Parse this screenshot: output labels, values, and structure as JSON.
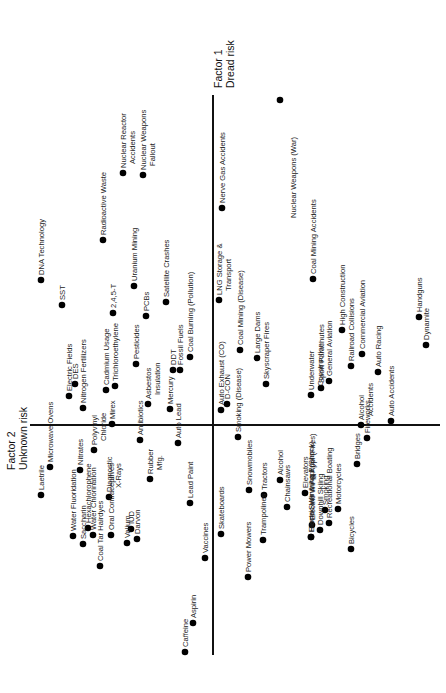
{
  "chart_data": {
    "type": "scatter",
    "title": "",
    "orientation": "rotated-90-ccw",
    "axes": {
      "factor1": {
        "label_line1": "Factor 1",
        "label_line2": "Dread risk",
        "pixel_position": {
          "x": 213,
          "y_top": 95,
          "y_bottom": 655
        }
      },
      "factor2": {
        "label_line1": "Factor 2",
        "label_line2": "Unknown risk",
        "pixel_position": {
          "y": 425,
          "x_left": 30,
          "x_right": 440
        }
      }
    },
    "xlabel": "Factor 1 Dread risk",
    "ylabel": "Factor 2 Unknown risk",
    "grid": false,
    "legend": null,
    "points": [
      {
        "label": "Nuclear Weapons (War)",
        "px": 280,
        "py": 100,
        "lines": [
          "Nuclear Weapons (War)"
        ],
        "lx": 296,
        "ly": 218
      },
      {
        "label": "Nerve Gas Accidents",
        "px": 222,
        "py": 208,
        "lines": [
          "Nerve Gas Accidents"
        ]
      },
      {
        "label": "Nuclear Reactor Accidents",
        "px": 123,
        "py": 173,
        "lines": [
          "Nuclear Reactor",
          "Accidents"
        ]
      },
      {
        "label": "Nuclear Weapons Fallout",
        "px": 143,
        "py": 175,
        "lines": [
          "Nuclear Weapons",
          "Fallout"
        ]
      },
      {
        "label": "Radioactive Waste",
        "px": 103,
        "py": 240,
        "lines": [
          "Radioactive Waste"
        ]
      },
      {
        "label": "DNA Technology",
        "px": 41,
        "py": 280,
        "lines": [
          "DNA Technology"
        ]
      },
      {
        "label": "Uranium Mining",
        "px": 134,
        "py": 286,
        "lines": [
          "Uranium Mining"
        ]
      },
      {
        "label": "SST",
        "px": 62,
        "py": 305,
        "lines": [
          "SST"
        ]
      },
      {
        "label": "LNG Storage & Transport",
        "px": 219,
        "py": 300,
        "lines": [
          "LNG Storage &",
          "Transport"
        ]
      },
      {
        "label": "Coal Mining Accidents",
        "px": 313,
        "py": 279,
        "lines": [
          "Coal Mining Accidents"
        ]
      },
      {
        "label": "Satellite Crashes",
        "px": 166,
        "py": 302,
        "lines": [
          "Satellite Crashes"
        ]
      },
      {
        "label": "2,4,5-T",
        "px": 113,
        "py": 313,
        "lines": [
          "2,4,5-T"
        ]
      },
      {
        "label": "PCBs",
        "px": 146,
        "py": 316,
        "lines": [
          "PCBs"
        ]
      },
      {
        "label": "Coal Mining (Disease)",
        "px": 240,
        "py": 350,
        "lines": [
          "Coal Mining (Disease)"
        ]
      },
      {
        "label": "Large Dams",
        "px": 257,
        "py": 358,
        "lines": [
          "Large Dams"
        ]
      },
      {
        "label": "High Construction",
        "px": 342,
        "py": 330,
        "lines": [
          "High Construction"
        ]
      },
      {
        "label": "Railroad Collisions",
        "px": 351,
        "py": 366,
        "lines": [
          "Railroad Collisions"
        ]
      },
      {
        "label": "Commercial Aviation",
        "px": 362,
        "py": 354,
        "lines": [
          "Commercial Aviation"
        ]
      },
      {
        "label": "General Aviation",
        "px": 329,
        "py": 381,
        "lines": [
          "General Aviation"
        ]
      },
      {
        "label": "Sport Parachutes",
        "px": 321,
        "py": 388,
        "lines": [
          "Sport Parachutes"
        ]
      },
      {
        "label": "Underwater Construction",
        "px": 311,
        "py": 395,
        "lines": [
          "Underwater",
          "Construction"
        ]
      },
      {
        "label": "Skyscraper Fires",
        "px": 266,
        "py": 384,
        "lines": [
          "Skyscraper Fires"
        ]
      },
      {
        "label": "Auto Racing",
        "px": 378,
        "py": 372,
        "lines": [
          "Auto Racing"
        ]
      },
      {
        "label": "Auto Accidents",
        "px": 391,
        "py": 421,
        "lines": [
          "Auto Accidents"
        ]
      },
      {
        "label": "Handguns",
        "px": 419,
        "py": 317,
        "lines": [
          "Handguns"
        ]
      },
      {
        "label": "Dynamite",
        "px": 426,
        "py": 345,
        "lines": [
          "Dynamite"
        ]
      },
      {
        "label": "Alcohol Accidents",
        "px": 361,
        "py": 425,
        "lines": [
          "Alcohol",
          "Accidents"
        ]
      },
      {
        "label": "Electric Fields",
        "px": 69,
        "py": 396,
        "lines": [
          "Electric Fields"
        ]
      },
      {
        "label": "DES",
        "px": 75,
        "py": 384,
        "lines": [
          "DES"
        ]
      },
      {
        "label": "Nitrogen Fertilizers",
        "px": 83,
        "py": 408,
        "lines": [
          "Nitrogen Fertilizers"
        ]
      },
      {
        "label": "Cadmium Usage",
        "px": 106,
        "py": 390,
        "lines": [
          "Cadmium Usage"
        ]
      },
      {
        "label": "Trichloroethylene",
        "px": 115,
        "py": 386,
        "lines": [
          "Trichloroethylene"
        ]
      },
      {
        "label": "Pesticides",
        "px": 136,
        "py": 364,
        "lines": [
          "Pesticides"
        ]
      },
      {
        "label": "Mirex",
        "px": 112,
        "py": 424,
        "lines": [
          "Mirex"
        ]
      },
      {
        "label": "Asbestos Insulation",
        "px": 148,
        "py": 404,
        "lines": [
          "Asbestos",
          "Insulation"
        ]
      },
      {
        "label": "DDT",
        "px": 173,
        "py": 370,
        "lines": [
          "DDT"
        ]
      },
      {
        "label": "Fossil Fuels",
        "px": 180,
        "py": 370,
        "lines": [
          "Fossil Fuels"
        ]
      },
      {
        "label": "Coal Burning (Pollution)",
        "px": 190,
        "py": 357,
        "lines": [
          "Coal Burning (Pollution)"
        ]
      },
      {
        "label": "Mercury",
        "px": 170,
        "py": 409,
        "lines": [
          "Mercury"
        ]
      },
      {
        "label": "Auto Exhaust (CO)",
        "px": 221,
        "py": 410,
        "lines": [
          "Auto Exhaust (CO)"
        ]
      },
      {
        "label": "D-CON",
        "px": 227,
        "py": 404,
        "lines": [
          "D-CON"
        ]
      },
      {
        "label": "Laetrile",
        "px": 41,
        "py": 495,
        "lines": [
          "Laetrile"
        ]
      },
      {
        "label": "Microwave Ovens",
        "px": 50,
        "py": 467,
        "lines": [
          "Microwave Ovens"
        ]
      },
      {
        "label": "Nitrates",
        "px": 80,
        "py": 470,
        "lines": [
          "Nitrates"
        ]
      },
      {
        "label": "Hexachlorophene",
        "px": 88,
        "py": 528,
        "lines": [
          "Hexachlorophene"
        ]
      },
      {
        "label": "Polyvinyl Chloride",
        "px": 94,
        "py": 450,
        "lines": [
          "Polyvinyl",
          "Chloride"
        ]
      },
      {
        "label": "Diagnostic X-Rays",
        "px": 109,
        "py": 497,
        "lines": [
          "Diagnostic",
          "X-Rays"
        ]
      },
      {
        "label": "Antibiotics",
        "px": 140,
        "py": 440,
        "lines": [
          "Antibiotics"
        ]
      },
      {
        "label": "Rubber Mfg.",
        "px": 150,
        "py": 479,
        "lines": [
          "Rubber",
          "Mfg."
        ]
      },
      {
        "label": "Auto Lead",
        "px": 178,
        "py": 443,
        "lines": [
          "Auto Lead"
        ]
      },
      {
        "label": "Lead Paint",
        "px": 190,
        "py": 503,
        "lines": [
          "Lead Paint"
        ]
      },
      {
        "label": "Water Fluoridation",
        "px": 73,
        "py": 536,
        "lines": [
          "Water Fluoridation"
        ]
      },
      {
        "label": "Saccharin",
        "px": 83,
        "py": 544,
        "lines": [
          "Saccharin"
        ]
      },
      {
        "label": "Water Chlorination",
        "px": 93,
        "py": 535,
        "lines": [
          "Water Chlorination"
        ]
      },
      {
        "label": "Coal Tar Hairdyes",
        "px": 100,
        "py": 566,
        "lines": [
          "Coal Tar Hairdyes"
        ]
      },
      {
        "label": "Oral Contraceptives",
        "px": 111,
        "py": 535,
        "lines": [
          "Oral Contraceptives"
        ]
      },
      {
        "label": "IUD",
        "px": 131,
        "py": 529,
        "lines": [
          "IUD"
        ]
      },
      {
        "label": "Darvon",
        "px": 137,
        "py": 539,
        "lines": [
          "Darvon"
        ]
      },
      {
        "label": "Valium",
        "px": 127,
        "py": 543,
        "lines": [
          "Valium"
        ]
      },
      {
        "label": "Vaccines",
        "px": 205,
        "py": 558,
        "lines": [
          "Vaccines"
        ]
      },
      {
        "label": "Caffeine",
        "px": 185,
        "py": 652,
        "lines": [
          "Caffeine"
        ]
      },
      {
        "label": "Aspirin",
        "px": 193,
        "py": 623,
        "lines": [
          "Aspirin"
        ]
      },
      {
        "label": "Skateboards",
        "px": 221,
        "py": 534,
        "lines": [
          "Skateboards"
        ]
      },
      {
        "label": "Smoking (Disease)",
        "px": 238,
        "py": 437,
        "lines": [
          "Smoking (Disease)"
        ]
      },
      {
        "label": "Snowmobiles",
        "px": 249,
        "py": 490,
        "lines": [
          "Snowmobiles"
        ]
      },
      {
        "label": "Power Mowers",
        "px": 248,
        "py": 577,
        "lines": [
          "Power Mowers"
        ]
      },
      {
        "label": "Tractors",
        "px": 264,
        "py": 495,
        "lines": [
          "Tractors"
        ]
      },
      {
        "label": "Trampolines",
        "px": 263,
        "py": 540,
        "lines": [
          "Trampolines"
        ]
      },
      {
        "label": "Alcohol",
        "px": 280,
        "py": 480,
        "lines": [
          "Alcohol"
        ]
      },
      {
        "label": "Chainsaws",
        "px": 287,
        "py": 507,
        "lines": [
          "Chainsaws"
        ]
      },
      {
        "label": "Elevators",
        "px": 305,
        "py": 493,
        "lines": [
          "Elevators"
        ]
      },
      {
        "label": "Electric Wir & Appl (Fires)",
        "px": 312,
        "py": 525,
        "lines": [
          "Electric Wir & Appl (Fires)"
        ]
      },
      {
        "label": "Smoking",
        "px": 325,
        "py": 510,
        "lines": [
          "Smoking"
        ]
      },
      {
        "label": "Motorcycles",
        "px": 338,
        "py": 509,
        "lines": [
          "Motorcycles"
        ]
      },
      {
        "label": "Home Swimming Pools",
        "px": 311,
        "py": 537,
        "lines": [
          "Home Swimming Pools"
        ]
      },
      {
        "label": "Downhill Skiing",
        "px": 320,
        "py": 530,
        "lines": [
          "Downhill Skiing"
        ]
      },
      {
        "label": "Recreational Boating",
        "px": 329,
        "py": 523,
        "lines": [
          "Recreational Boating"
        ]
      },
      {
        "label": "Electric Wir & Appl (Shock)",
        "px": 311,
        "py": 537,
        "lines": [
          "Electric Wir & Appl (Shock)"
        ]
      },
      {
        "label": "Bicycles",
        "px": 351,
        "py": 549,
        "lines": [
          "Bicycles"
        ]
      },
      {
        "label": "Bridges",
        "px": 357,
        "py": 464,
        "lines": [
          "Bridges"
        ]
      },
      {
        "label": "Fireworks",
        "px": 367,
        "py": 438,
        "lines": [
          "Fireworks"
        ]
      }
    ]
  }
}
